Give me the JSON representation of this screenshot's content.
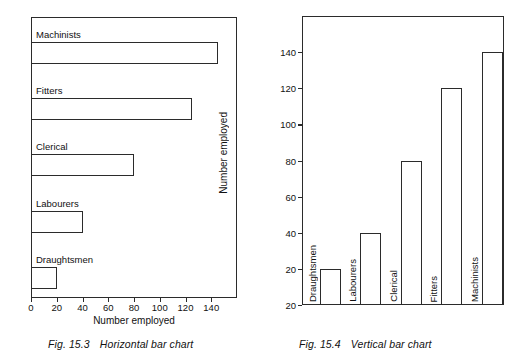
{
  "page": {
    "background": "#ffffff",
    "ink": "#2b2b2b"
  },
  "figures": [
    {
      "id": "fig-horizontal",
      "caption_number": "Fig. 15.3",
      "caption_text": "Horizontal bar chart"
    },
    {
      "id": "fig-vertical",
      "caption_number": "Fig. 15.4",
      "caption_text": "Vertical bar chart"
    }
  ],
  "chart_data": [
    {
      "type": "bar",
      "orientation": "horizontal",
      "title": "",
      "figure_label": "Fig. 15.3",
      "figure_caption": "Horizontal bar chart",
      "categories": [
        "Draughtsmen",
        "Labourers",
        "Clerical",
        "Fitters",
        "Machinists"
      ],
      "values": [
        20,
        40,
        80,
        125,
        145
      ],
      "xlabel": "Number employed",
      "ylabel": "",
      "xlim": [
        0,
        160
      ],
      "xticks": [
        0,
        20,
        40,
        60,
        80,
        100,
        120,
        140
      ],
      "xticklabels": [
        "0",
        "20",
        "40",
        "60",
        "80",
        "100",
        "120",
        "140"
      ],
      "grid": false,
      "legend": false,
      "bar_fill": "#ffffff",
      "bar_edge": "#2b2b2b",
      "category_labels_inside_plot": true,
      "category_order_top_to_bottom": [
        "Machinists",
        "Fitters",
        "Clerical",
        "Labourers",
        "Draughtsmen"
      ]
    },
    {
      "type": "bar",
      "orientation": "vertical",
      "title": "",
      "figure_label": "Fig. 15.4",
      "figure_caption": "Vertical bar chart",
      "categories": [
        "Draughtsmen",
        "Labourers",
        "Clerical",
        "Fitters",
        "Machinists"
      ],
      "values": [
        20,
        40,
        80,
        120,
        140
      ],
      "xlabel": "",
      "ylabel": "Number employed",
      "ylim": [
        0,
        160
      ],
      "yticks": [
        20,
        40,
        60,
        80,
        100,
        120,
        140
      ],
      "yticklabels": [
        "20",
        "40",
        "60",
        "80",
        "100",
        "120",
        "140"
      ],
      "baseline_label": "20",
      "grid": false,
      "legend": false,
      "bar_fill": "#ffffff",
      "bar_edge": "#2b2b2b",
      "category_labels_rotated": true
    }
  ],
  "horizontal_chart": {
    "axis_title": "Number employed",
    "ticks": [
      {
        "label": "0",
        "value": 0
      },
      {
        "label": "20",
        "value": 20
      },
      {
        "label": "40",
        "value": 40
      },
      {
        "label": "60",
        "value": 60
      },
      {
        "label": "80",
        "value": 80
      },
      {
        "label": "100",
        "value": 100
      },
      {
        "label": "120",
        "value": 120
      },
      {
        "label": "140",
        "value": 140
      }
    ],
    "bars": [
      {
        "label": "Machinists",
        "value": 145
      },
      {
        "label": "Fitters",
        "value": 125
      },
      {
        "label": "Clerical",
        "value": 80
      },
      {
        "label": "Labourers",
        "value": 40
      },
      {
        "label": "Draughtsmen",
        "value": 20
      }
    ],
    "caption_number": "Fig. 15.3",
    "caption_text": "Horizontal bar chart"
  },
  "vertical_chart": {
    "axis_title": "Number employed",
    "ticks": [
      {
        "label": "140",
        "value": 140
      },
      {
        "label": "120",
        "value": 120
      },
      {
        "label": "100",
        "value": 100
      },
      {
        "label": "80",
        "value": 80
      },
      {
        "label": "60",
        "value": 60
      },
      {
        "label": "40",
        "value": 40
      },
      {
        "label": "20",
        "value": 20
      },
      {
        "label": "20",
        "value": 0
      }
    ],
    "bars": [
      {
        "label": "Draughtsmen",
        "value": 20
      },
      {
        "label": "Labourers",
        "value": 40
      },
      {
        "label": "Clerical",
        "value": 80
      },
      {
        "label": "Fitters",
        "value": 120
      },
      {
        "label": "Machinists",
        "value": 140
      }
    ],
    "caption_number": "Fig. 15.4",
    "caption_text": "Vertical bar chart"
  }
}
